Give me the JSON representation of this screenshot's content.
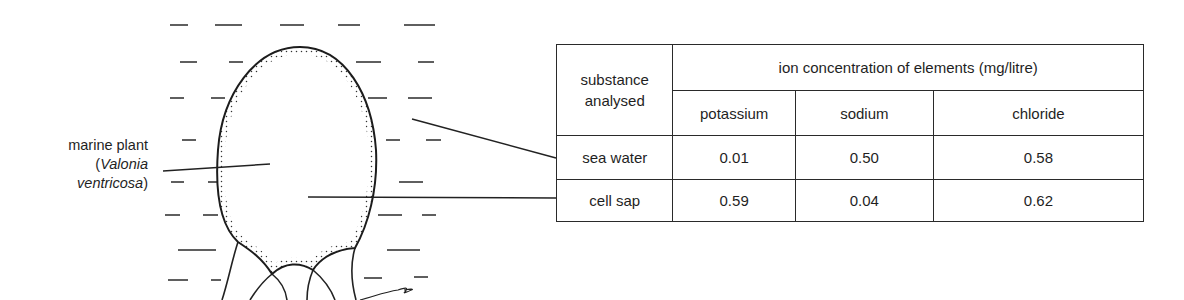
{
  "diagram": {
    "plant_label": {
      "line1": "marine plant",
      "open_paren": "(",
      "genus": "Valonia",
      "species": "ventricosa",
      "close_paren": ")"
    },
    "figure": "marine plant cell (Valonia ventricosa) suspended in sea water, with pointer lines from sea water and cell interior to the table rows"
  },
  "table": {
    "row_header_title_line1": "substance",
    "row_header_title_line2": "analysed",
    "group_header": "ion concentration of elements (mg/litre)",
    "columns": [
      "potassium",
      "sodium",
      "chloride"
    ],
    "rows": [
      {
        "label": "sea water",
        "values": [
          "0.01",
          "0.50",
          "0.58"
        ]
      },
      {
        "label": "cell sap",
        "values": [
          "0.59",
          "0.04",
          "0.62"
        ]
      }
    ],
    "unit": "mg/litre"
  },
  "colors": {
    "ink": "#1f1f1f",
    "background": "#ffffff"
  }
}
